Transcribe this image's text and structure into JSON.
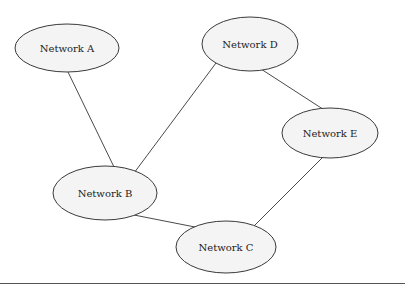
{
  "diagram": {
    "type": "network-topology",
    "nodes": [
      {
        "id": "A",
        "label": "Network A",
        "cx": 67,
        "cy": 48,
        "rx": 52,
        "ry": 24
      },
      {
        "id": "D",
        "label": "Network D",
        "cx": 250,
        "cy": 44,
        "rx": 48,
        "ry": 27
      },
      {
        "id": "E",
        "label": "Network E",
        "cx": 330,
        "cy": 133,
        "rx": 48,
        "ry": 25
      },
      {
        "id": "B",
        "label": "Network B",
        "cx": 105,
        "cy": 193,
        "rx": 52,
        "ry": 27
      },
      {
        "id": "C",
        "label": "Network C",
        "cx": 226,
        "cy": 247,
        "rx": 50,
        "ry": 26
      }
    ],
    "edges": [
      {
        "from": "A",
        "to": "B",
        "x1": 68,
        "y1": 72,
        "x2": 114,
        "y2": 167
      },
      {
        "from": "D",
        "to": "B",
        "x1": 216,
        "y1": 63,
        "x2": 134,
        "y2": 173
      },
      {
        "from": "D",
        "to": "E",
        "x1": 261,
        "y1": 69,
        "x2": 332,
        "y2": 115
      },
      {
        "from": "B",
        "to": "C",
        "x1": 134,
        "y1": 215,
        "x2": 200,
        "y2": 228
      },
      {
        "from": "E",
        "to": "C",
        "x1": 324,
        "y1": 156,
        "x2": 252,
        "y2": 228
      }
    ]
  },
  "colors": {
    "node_fill": "#f4f4f4",
    "node_stroke": "#3a3a3a",
    "edge": "#4a4a4a",
    "text": "#222222",
    "rule": "#555555"
  }
}
